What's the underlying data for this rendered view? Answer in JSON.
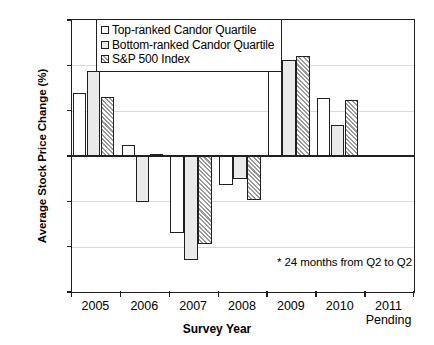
{
  "chart_data": {
    "type": "bar",
    "title": "",
    "xlabel": "Survey Year",
    "ylabel": "Average Stock Price Change (%)",
    "ylim": [
      -60,
      60
    ],
    "ytick_values": [
      60,
      40,
      20,
      0,
      -20,
      -40,
      -60
    ],
    "ytick_labels": [
      "60",
      "40",
      "20",
      "0",
      "-20",
      "-40",
      "-60"
    ],
    "grid": true,
    "legend_position": "top-left-inside",
    "categories": [
      "2005",
      "2006",
      "2007",
      "2008",
      "2009",
      "2010",
      "2011"
    ],
    "category_sublabels": [
      "",
      "",
      "",
      "",
      "",
      "",
      "Pending"
    ],
    "series": [
      {
        "name": "Top-ranked Candor Quartile",
        "fill": "white",
        "values": [
          28,
          5,
          -34,
          -13,
          50,
          25.5,
          null
        ]
      },
      {
        "name": "Bottom-ranked Candor Quartile",
        "fill": "light-gray",
        "values": [
          37.5,
          -20.5,
          -46,
          -10,
          42.5,
          13.5,
          null
        ]
      },
      {
        "name": "S&P 500 Index",
        "fill": "diagonal-hatch",
        "values": [
          26,
          1,
          -39,
          -19.5,
          44,
          24.5,
          null
        ]
      }
    ],
    "annotations": [
      {
        "id": "footnote",
        "text": "* 24 months from Q2 to Q2"
      }
    ],
    "colors": {
      "axis": "#231f20",
      "grid": "#d9d9d9",
      "series_1": "#ffffff",
      "series_2": "#eaeaea",
      "series_3": "#9a9a9a"
    }
  },
  "legend": {
    "items": [
      {
        "label": "Top-ranked Candor Quartile"
      },
      {
        "label": "Bottom-ranked Candor Quartile"
      },
      {
        "label": "S&P 500 Index"
      }
    ]
  },
  "axes": {
    "x_title": "Survey Year",
    "y_title": "Average Stock Price Change (%)"
  },
  "footnote": {
    "text": "* 24 months from Q2 to Q2"
  }
}
